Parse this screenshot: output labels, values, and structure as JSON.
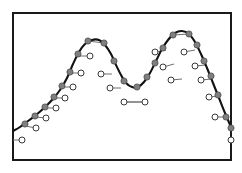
{
  "figure": {
    "title": "",
    "background": "#ffffff",
    "frame": {
      "name": "plot-frame",
      "x": 13,
      "y": 13,
      "width": 218,
      "height": 147,
      "stroke": "#1a1a1a",
      "stroke_width": 2,
      "fill": "#ffffff"
    },
    "styles": {
      "curve_color": "#111111",
      "curve_width": 2.1,
      "marker_fill": "#7f7f7f",
      "marker_stroke": "#4d4d4d",
      "marker_radius": 3.1,
      "open_fill": "#ffffff",
      "open_stroke": "#3a3a3a",
      "open_radius": 3.0,
      "connector_color": "#6e6e6e",
      "connector_width": 1.0
    }
  },
  "chart_data": {
    "type": "line",
    "title": "",
    "xlabel": "",
    "ylabel": "",
    "xlim": [
      13,
      231
    ],
    "ylim": [
      160,
      13
    ],
    "grid": false,
    "legend": null,
    "curve": {
      "name": "bimodal-curve",
      "points": [
        [
          13,
          131
        ],
        [
          20,
          127
        ],
        [
          28,
          121
        ],
        [
          36,
          115
        ],
        [
          44,
          108
        ],
        [
          52,
          100
        ],
        [
          60,
          90
        ],
        [
          67,
          78
        ],
        [
          73,
          64
        ],
        [
          79,
          52
        ],
        [
          85,
          44
        ],
        [
          92,
          40
        ],
        [
          99,
          40
        ],
        [
          105,
          45
        ],
        [
          111,
          54
        ],
        [
          116,
          65
        ],
        [
          121,
          75
        ],
        [
          126,
          83
        ],
        [
          132,
          87
        ],
        [
          138,
          87
        ],
        [
          144,
          82
        ],
        [
          150,
          73
        ],
        [
          156,
          61
        ],
        [
          162,
          49
        ],
        [
          168,
          40
        ],
        [
          175,
          33
        ],
        [
          182,
          31
        ],
        [
          189,
          34
        ],
        [
          195,
          42
        ],
        [
          201,
          54
        ],
        [
          207,
          68
        ],
        [
          213,
          83
        ],
        [
          219,
          98
        ],
        [
          225,
          113
        ],
        [
          231,
          127
        ]
      ]
    },
    "curve_markers": [
      {
        "id": "m1",
        "x": 25,
        "y": 124
      },
      {
        "id": "m2",
        "x": 35,
        "y": 116
      },
      {
        "id": "m3",
        "x": 45,
        "y": 107
      },
      {
        "id": "m4",
        "x": 54,
        "y": 97
      },
      {
        "id": "m5",
        "x": 62,
        "y": 86
      },
      {
        "id": "m6",
        "x": 70,
        "y": 72
      },
      {
        "id": "m7",
        "x": 78,
        "y": 54
      },
      {
        "id": "m8",
        "x": 88,
        "y": 41
      },
      {
        "id": "m9",
        "x": 104,
        "y": 43
      },
      {
        "id": "m10",
        "x": 114,
        "y": 61
      },
      {
        "id": "m11",
        "x": 124,
        "y": 81
      },
      {
        "id": "m12",
        "x": 137,
        "y": 87
      },
      {
        "id": "m13",
        "x": 147,
        "y": 77
      },
      {
        "id": "m14",
        "x": 155,
        "y": 63
      },
      {
        "id": "m15",
        "x": 163,
        "y": 48
      },
      {
        "id": "m16",
        "x": 173,
        "y": 35
      },
      {
        "id": "m17",
        "x": 189,
        "y": 34
      },
      {
        "id": "m18",
        "x": 197,
        "y": 45
      },
      {
        "id": "m19",
        "x": 204,
        "y": 61
      },
      {
        "id": "m20",
        "x": 211,
        "y": 76
      },
      {
        "id": "m21",
        "x": 218,
        "y": 95
      },
      {
        "id": "m22",
        "x": 226,
        "y": 117
      },
      {
        "id": "m23",
        "x": 231,
        "y": 128
      }
    ],
    "peak_chords": [
      {
        "id": "chord-left",
        "x1": 88,
        "y1": 41,
        "x2": 104,
        "y2": 43
      },
      {
        "id": "chord-right",
        "x1": 173,
        "y1": 35,
        "x2": 189,
        "y2": 34
      }
    ],
    "open_markers": [
      {
        "id": "o0",
        "x": 22,
        "y": 140,
        "link_x": 13,
        "link_y": 140
      },
      {
        "id": "o1",
        "x": 36,
        "y": 128,
        "link_x": 25,
        "link_y": 126
      },
      {
        "id": "o2",
        "x": 46,
        "y": 118,
        "link_x": 35,
        "link_y": 117
      },
      {
        "id": "o3",
        "x": 56,
        "y": 108,
        "link_x": 45,
        "link_y": 108
      },
      {
        "id": "o4",
        "x": 65,
        "y": 98,
        "link_x": 54,
        "link_y": 98
      },
      {
        "id": "o5",
        "x": 73,
        "y": 87,
        "link_x": 62,
        "link_y": 87
      },
      {
        "id": "o6",
        "x": 81,
        "y": 73,
        "link_x": 70,
        "link_y": 73
      },
      {
        "id": "o7",
        "x": 90,
        "y": 56,
        "link_x": 79,
        "link_y": 56
      },
      {
        "id": "o8",
        "x": 101,
        "y": 74,
        "link_x": 112,
        "link_y": 74
      },
      {
        "id": "o9",
        "x": 110,
        "y": 88,
        "link_x": 121,
        "link_y": 88
      },
      {
        "id": "o10",
        "x": 124,
        "y": 102,
        "link_x": 145,
        "link_y": 102
      },
      {
        "id": "o11",
        "x": 145,
        "y": 102,
        "link_x": 124,
        "link_y": 102
      },
      {
        "id": "o12",
        "x": 155,
        "y": 52,
        "link_x": 166,
        "link_y": 50
      },
      {
        "id": "o13",
        "x": 163,
        "y": 67,
        "link_x": 174,
        "link_y": 64
      },
      {
        "id": "o14",
        "x": 171,
        "y": 80,
        "link_x": 182,
        "link_y": 79
      },
      {
        "id": "o15",
        "x": 184,
        "y": 52,
        "link_x": 195,
        "link_y": 50
      },
      {
        "id": "o16",
        "x": 195,
        "y": 66,
        "link_x": 206,
        "link_y": 65
      },
      {
        "id": "o17",
        "x": 201,
        "y": 80,
        "link_x": 212,
        "link_y": 79
      },
      {
        "id": "o18",
        "x": 209,
        "y": 97,
        "link_x": 219,
        "link_y": 96
      },
      {
        "id": "o19",
        "x": 215,
        "y": 117,
        "link_x": 226,
        "link_y": 117
      },
      {
        "id": "o20",
        "x": 231,
        "y": 140,
        "link_x": 231,
        "link_y": 140
      }
    ]
  }
}
